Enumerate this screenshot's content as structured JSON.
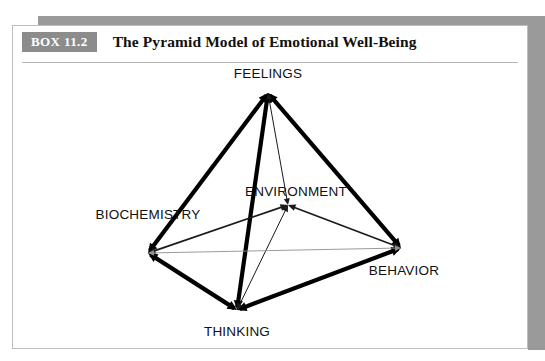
{
  "box": {
    "badge_label": "BOX 11.2",
    "title": "The Pyramid Model of Emotional Well-Being"
  },
  "colors": {
    "badge_background": "#8c8c8c",
    "badge_text": "#ffffff",
    "page_background": "#ffffff",
    "frame_shadow": "#9a9a9a",
    "panel_border": "#bdbdbd",
    "rule": "#b5b5b5",
    "edge_thick": "#000000",
    "edge_medium": "#1a1a1a",
    "edge_faint": "#8f8f8f",
    "label_text": "#111111"
  },
  "chart_data": {
    "type": "diagram",
    "title": "The Pyramid Model of Emotional Well-Being",
    "subtype": "tetrahedron-network",
    "nodes": [
      {
        "id": "feelings",
        "label": "FEELINGS",
        "x": 268,
        "y": 93,
        "label_x": 268,
        "label_y": 78,
        "label_anchor": "middle"
      },
      {
        "id": "biochemistry",
        "label": "BIOCHEMISTRY",
        "x": 148,
        "y": 253,
        "label_x": 148,
        "label_y": 219,
        "label_anchor": "middle"
      },
      {
        "id": "environment",
        "label": "ENVIRONMENT",
        "x": 288,
        "y": 205,
        "label_x": 296,
        "label_y": 196,
        "label_anchor": "middle"
      },
      {
        "id": "behavior",
        "label": "BEHAVIOR",
        "x": 401,
        "y": 248,
        "label_x": 404,
        "label_y": 275,
        "label_anchor": "middle"
      },
      {
        "id": "thinking",
        "label": "THINKING",
        "x": 237,
        "y": 310,
        "label_x": 237,
        "label_y": 336,
        "label_anchor": "middle"
      }
    ],
    "edges": [
      {
        "from": "feelings",
        "to": "biochemistry",
        "weight": "thick",
        "arrows": "both"
      },
      {
        "from": "feelings",
        "to": "behavior",
        "weight": "thick",
        "arrows": "both"
      },
      {
        "from": "feelings",
        "to": "thinking",
        "weight": "thick",
        "arrows": "both"
      },
      {
        "from": "biochemistry",
        "to": "thinking",
        "weight": "thick",
        "arrows": "both"
      },
      {
        "from": "thinking",
        "to": "behavior",
        "weight": "thick",
        "arrows": "both"
      },
      {
        "from": "biochemistry",
        "to": "environment",
        "weight": "medium",
        "arrows": "both"
      },
      {
        "from": "environment",
        "to": "behavior",
        "weight": "medium",
        "arrows": "both"
      },
      {
        "from": "environment",
        "to": "feelings",
        "weight": "thin",
        "arrows": "both"
      },
      {
        "from": "environment",
        "to": "thinking",
        "weight": "thin",
        "arrows": "both"
      },
      {
        "from": "biochemistry",
        "to": "behavior",
        "weight": "faint",
        "arrows": "both"
      }
    ],
    "legend": [],
    "annotations": []
  }
}
